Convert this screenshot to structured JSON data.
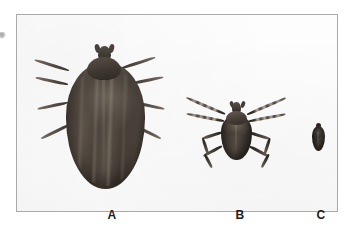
{
  "figure": {
    "name": "tick-size-comparison-plate",
    "background_color": "#ffffff",
    "plate_background_color": "#fbfbfb",
    "border_color": "#a9a9ad",
    "specimen_color": "#3b342e"
  },
  "specimens": [
    {
      "label": "A",
      "name": "engorged-adult-tick",
      "description": "Large engorged tick with swollen oval body and eight legs"
    },
    {
      "label": "B",
      "name": "unfed-adult-tick",
      "description": "Unfed adult tick with scutum, capitulum and spread banded legs"
    },
    {
      "label": "C",
      "name": "nymph-tick",
      "description": "Small dark nymph-stage tick shown as a tiny oval"
    }
  ]
}
